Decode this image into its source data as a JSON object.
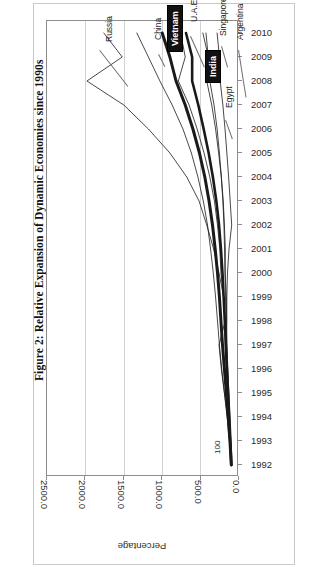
{
  "figure": {
    "caption": "Figure 2: Relative Expansion of Dynamic Economies since 1990s",
    "data_label_100": "100"
  },
  "axes": {
    "value_axis_title": "Percentage",
    "value_ticks": [
      "2500.0",
      "2000.0",
      "1500.0",
      "1000.0",
      "500.0",
      "0.0"
    ],
    "category_ticks": [
      "2010",
      "2009",
      "2008",
      "2007",
      "2006",
      "2005",
      "2004",
      "2003",
      "2002",
      "2001",
      "2000",
      "1999",
      "1998",
      "1997",
      "1996",
      "1995",
      "1994",
      "1993",
      "1992"
    ]
  },
  "series_labels": [
    {
      "name": "Russia",
      "boxed": false
    },
    {
      "name": "China",
      "boxed": false
    },
    {
      "name": "Vietnam",
      "boxed": true
    },
    {
      "name": "U.A.E",
      "boxed": false
    },
    {
      "name": "Singapore",
      "boxed": false
    },
    {
      "name": "Argentina",
      "boxed": false
    },
    {
      "name": "India",
      "boxed": true
    },
    {
      "name": "Egypt",
      "boxed": false
    }
  ],
  "chart_data": {
    "type": "line",
    "title": "Figure 2: Relative Expansion of Dynamic Economies since 1990s",
    "xlabel": "Percentage",
    "ylabel": "",
    "orientation": "horizontal-value-axis-with-vertical-category-axis",
    "value_axis_reversed": true,
    "xlim": [
      0,
      2500
    ],
    "ylim_categories": [
      "1992",
      "2010"
    ],
    "grid": "vertical gridlines at every 500 units",
    "legend": "none — series named by leader-line callouts inside plot",
    "categories": [
      "1992",
      "1993",
      "1994",
      "1995",
      "1996",
      "1997",
      "1998",
      "1999",
      "2000",
      "2001",
      "2002",
      "2003",
      "2004",
      "2005",
      "2006",
      "2007",
      "2008",
      "2009",
      "2010"
    ],
    "series": [
      {
        "name": "Russia",
        "values": [
          100,
          120,
          150,
          190,
          230,
          260,
          180,
          200,
          260,
          330,
          420,
          520,
          680,
          900,
          1180,
          1500,
          1980,
          1520,
          1760
        ]
      },
      {
        "name": "China",
        "values": [
          100,
          125,
          155,
          190,
          225,
          255,
          280,
          305,
          335,
          370,
          410,
          465,
          535,
          620,
          730,
          870,
          1030,
          1180,
          1330
        ]
      },
      {
        "name": "Vietnam",
        "values": [
          100,
          118,
          140,
          165,
          190,
          215,
          235,
          255,
          280,
          310,
          345,
          390,
          445,
          515,
          600,
          700,
          820,
          900,
          1000
        ]
      },
      {
        "name": "U.A.E",
        "values": [
          100,
          110,
          125,
          142,
          160,
          178,
          185,
          200,
          235,
          250,
          280,
          320,
          380,
          455,
          545,
          650,
          790,
          700,
          760
        ]
      },
      {
        "name": "India",
        "values": [
          100,
          112,
          126,
          142,
          158,
          172,
          185,
          200,
          215,
          235,
          260,
          295,
          340,
          395,
          460,
          530,
          610,
          610,
          690
        ]
      },
      {
        "name": "Singapore",
        "values": [
          100,
          112,
          128,
          145,
          160,
          172,
          160,
          165,
          180,
          178,
          190,
          205,
          230,
          265,
          305,
          355,
          420,
          400,
          470
        ]
      },
      {
        "name": "Egypt",
        "values": [
          100,
          110,
          120,
          132,
          145,
          158,
          168,
          176,
          182,
          188,
          196,
          210,
          230,
          255,
          285,
          325,
          380,
          400,
          430
        ]
      },
      {
        "name": "Argentina",
        "values": [
          100,
          112,
          122,
          135,
          148,
          158,
          160,
          158,
          150,
          130,
          95,
          115,
          135,
          158,
          182,
          210,
          245,
          255,
          285
        ]
      }
    ]
  }
}
